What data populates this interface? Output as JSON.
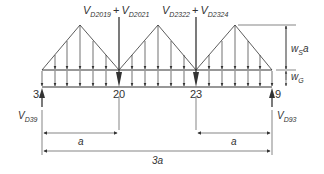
{
  "diagram": {
    "top_labels": {
      "load_20": {
        "base": "V",
        "sub": "D2019",
        "plus": "+",
        "base2": "V",
        "sub2": "D2021"
      },
      "load_23": {
        "base": "V",
        "sub": "D2322",
        "plus": "+",
        "base2": "V",
        "sub2": "D2324"
      }
    },
    "nodes": [
      "3",
      "20",
      "23",
      "9"
    ],
    "reactions": {
      "left": {
        "base": "V",
        "sub": "D39"
      },
      "right": {
        "base": "V",
        "sub": "D93"
      }
    },
    "loads": {
      "ws": {
        "base": "w",
        "sub": "S",
        "suffix": "a"
      },
      "wg": {
        "base": "w",
        "sub": "G"
      }
    },
    "dimensions": {
      "left_span": "a",
      "right_span": "a",
      "total": "3a"
    },
    "colors": {
      "line": "#333333",
      "background": "#ffffff"
    }
  }
}
